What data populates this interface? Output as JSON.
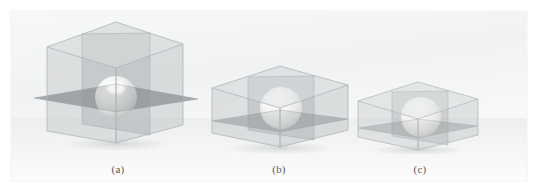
{
  "figure": {
    "background_color": "#ffffff",
    "panel_color": "#f2f3f4",
    "panel_edge_color": "#e8e9ea",
    "glass_color": "#b9bdbf",
    "glass_edge_color": "#9aa0a3",
    "sphere_highlight_color": "#ffffff",
    "sphere_body_color": "#e2e3e2",
    "sphere_shade_color": "#b9bbba",
    "plane_color": "#8e9295",
    "shadow_color": "#d9dbdc",
    "caption_color": "#5a5a5a",
    "panels": [
      {
        "id": "a",
        "caption": "(a)",
        "description": "tall transparent cube containing a sphere with intersecting cutting planes",
        "box_width": 120,
        "box_height": 118,
        "sphere_label": "sphere"
      },
      {
        "id": "b",
        "caption": "(b)",
        "description": "medium transparent box containing a sphere with intersecting cutting planes",
        "box_width": 120,
        "box_height": 74,
        "sphere_label": "sphere"
      },
      {
        "id": "c",
        "caption": "(c)",
        "description": "short transparent box containing a sphere protruding through the cutting plane",
        "box_width": 112,
        "box_height": 58,
        "sphere_label": "sphere"
      }
    ]
  }
}
